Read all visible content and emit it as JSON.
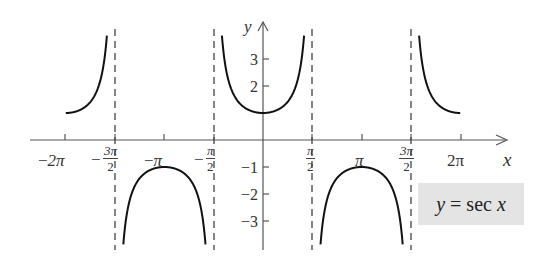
{
  "chart_data": {
    "type": "line",
    "title": "",
    "function": "y = sec x",
    "legend": {
      "text": "y = sec x",
      "position": "lower-right",
      "background": "#e4e4e4"
    },
    "xlabel": "x",
    "ylabel": "y",
    "xlim": [
      -6.283,
      6.283
    ],
    "ylim": [
      -4,
      4
    ],
    "x_ticks": [
      "-2π",
      "-3π/2",
      "-π",
      "-π/2",
      "π/2",
      "π",
      "3π/2",
      "2π"
    ],
    "y_ticks": [
      3,
      2,
      -1,
      -2,
      -3
    ],
    "asymptotes": [
      "-3π/2",
      "-π/2",
      "π/2",
      "3π/2"
    ],
    "asymptote_style": "dashed",
    "grid": false,
    "series": [
      {
        "name": "branch 1",
        "x_range": [
          "-2π",
          "-3π/2"
        ],
        "y_range": [
          1,
          4
        ]
      },
      {
        "name": "branch 2",
        "x_range": [
          "-3π/2",
          "-π/2"
        ],
        "y_range": [
          -4,
          -1
        ],
        "vertex": [
          "-π",
          -1
        ]
      },
      {
        "name": "branch 3",
        "x_range": [
          "-π/2",
          "π/2"
        ],
        "y_range": [
          1,
          4
        ],
        "vertex": [
          0,
          1
        ]
      },
      {
        "name": "branch 4",
        "x_range": [
          "π/2",
          "3π/2"
        ],
        "y_range": [
          -4,
          -1
        ],
        "vertex": [
          "π",
          -1
        ]
      },
      {
        "name": "branch 5",
        "x_range": [
          "3π/2",
          "2π"
        ],
        "y_range": [
          1,
          4
        ]
      }
    ]
  },
  "axes": {
    "x_label": "x",
    "y_label": "y",
    "x_ticks": {
      "neg2pi": "2π",
      "neg3pi2_num": "3π",
      "neg3pi2_den": "2",
      "negpi": "π",
      "negpi2_num": "π",
      "negpi2_den": "2",
      "pi2_num": "π",
      "pi2_den": "2",
      "pi": "π",
      "pi32_num": "3π",
      "pi32_den": "2",
      "twopi": "2π"
    },
    "minus_sign": "−",
    "y_ticks": {
      "p3": "3",
      "p2": "2",
      "m1": "−1",
      "m2": "−2",
      "m3": "−3"
    }
  },
  "legend": {
    "text_y": "y",
    "text_eq": " = sec ",
    "text_x": "x"
  }
}
